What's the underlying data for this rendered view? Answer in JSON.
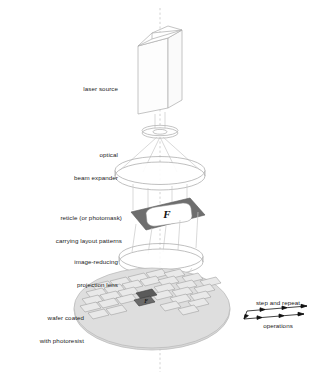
{
  "diagram": {
    "background_color": "#ffffff",
    "line_color": "#b4b4b4",
    "axis_color": "#bdbdbd",
    "reticle_plate_color": "#6e6e6e",
    "reticle_aperture_color": "#ffffff",
    "wafer_color": "#d8d8d8",
    "die_fill_color": "#e8e8e8",
    "highlight_die_color": "#555555",
    "arrow_color": "#111111",
    "text_color": "#1a1a1a"
  },
  "labels": {
    "laser_source": {
      "lines": [
        "laser source"
      ],
      "align": "right"
    },
    "beam_expander": {
      "lines": [
        "optical",
        "beam expander"
      ],
      "align": "right"
    },
    "reticle": {
      "lines": [
        "reticle (or photomask)",
        "carrying layout patterns"
      ],
      "align": "right"
    },
    "projection_lens": {
      "lines": [
        "image-reducing",
        "projection lens"
      ],
      "align": "right"
    },
    "wafer": {
      "lines": [
        "wafer coated",
        "with photoresist"
      ],
      "align": "right"
    },
    "step_repeat": {
      "lines": [
        "step and repeat",
        "operations"
      ],
      "align": "center"
    }
  },
  "reticle_pattern": {
    "glyph": "F"
  },
  "wafer_grid": {
    "columns": 7,
    "rows": 5,
    "highlighted_die_glyph": "F"
  }
}
